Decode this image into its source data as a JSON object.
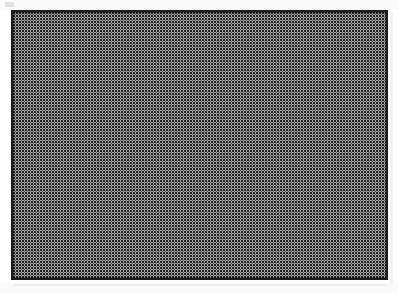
{
  "page": {
    "background_color": "#ffffff",
    "width_px": 398,
    "height_px": 293,
    "caption": ""
  },
  "figure": {
    "name": "halftone-filled-rectangle",
    "border_color": "#1c1c1c",
    "border_width_px": 2,
    "fill_description": "uniform halftone dot screen",
    "fill_dot_color": "#141414",
    "fill_paper_color": "#fdfdfd",
    "fill_dot_period_px": 3,
    "x_px": 11,
    "y_px": 10,
    "width_px": 377,
    "height_px": 270,
    "label": ""
  },
  "artifacts": {
    "smudge_color": "#d8d8d8",
    "scan_band_color": "#fbfbfb",
    "shadow_color": "#ededed"
  }
}
